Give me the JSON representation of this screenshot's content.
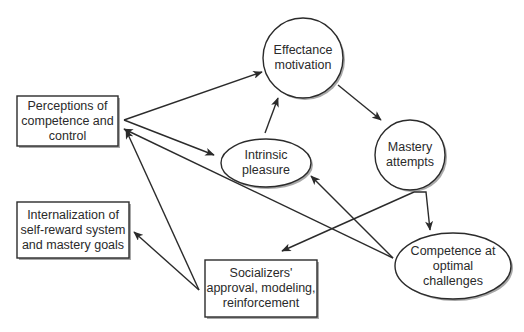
{
  "diagram": {
    "nodes": [
      {
        "id": "perceptions",
        "shape": "box",
        "label": "Perceptions of\ncompetence and\ncontrol"
      },
      {
        "id": "internalization",
        "shape": "box",
        "label": "Internalization of\nself-reward system\nand mastery goals"
      },
      {
        "id": "socializers",
        "shape": "box",
        "label": "Socializers'\napproval, modeling,\nreinforcement"
      },
      {
        "id": "effectance",
        "shape": "circle",
        "label": "Effectance\nmotivation"
      },
      {
        "id": "intrinsic",
        "shape": "ellipse",
        "label": "Intrinsic\npleasure"
      },
      {
        "id": "mastery",
        "shape": "circle",
        "label": "Mastery\nattempts"
      },
      {
        "id": "competence",
        "shape": "ellipse",
        "label": "Competence at\noptimal\nchallenges"
      }
    ],
    "edges": [
      {
        "from": "perceptions",
        "to": "effectance"
      },
      {
        "from": "perceptions",
        "to": "intrinsic"
      },
      {
        "from": "intrinsic",
        "to": "effectance"
      },
      {
        "from": "effectance",
        "to": "mastery"
      },
      {
        "from": "mastery",
        "to": "competence"
      },
      {
        "from": "mastery",
        "to": "socializers"
      },
      {
        "from": "competence",
        "to": "perceptions"
      },
      {
        "from": "competence",
        "to": "intrinsic"
      },
      {
        "from": "socializers",
        "to": "perceptions"
      },
      {
        "from": "socializers",
        "to": "internalization"
      }
    ],
    "colors": {
      "stroke": "#2b2b2b",
      "shadow": "#9a9a9a",
      "fill": "#ffffff"
    }
  }
}
